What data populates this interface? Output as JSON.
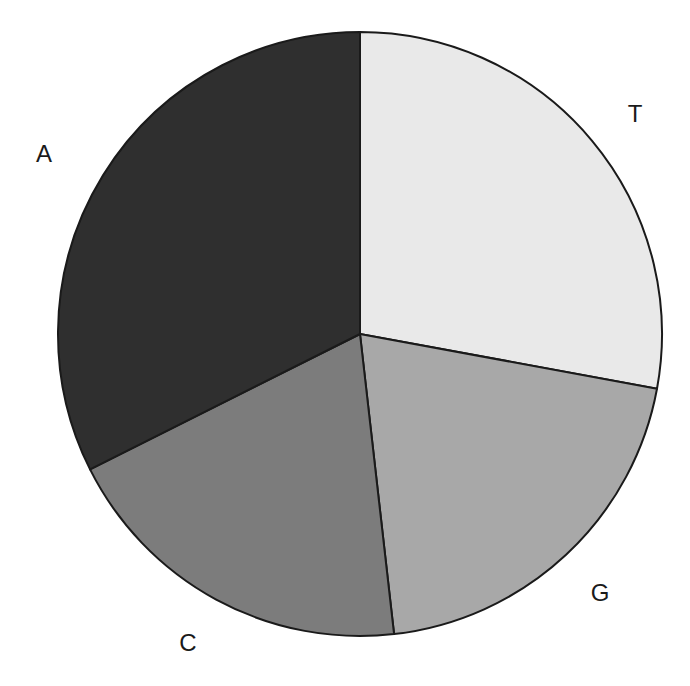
{
  "chart_data": {
    "type": "pie",
    "title": "",
    "start_angle_deg": 0,
    "direction": "clockwise",
    "categories": [
      "T",
      "G",
      "C",
      "A"
    ],
    "values": [
      27.9,
      20.3,
      19.4,
      32.4
    ],
    "colors": [
      "#e9e9e9",
      "#a8a8a8",
      "#7c7c7c",
      "#2f2f2f"
    ],
    "labels": [
      {
        "text": "T",
        "x": 635,
        "y": 122
      },
      {
        "text": "G",
        "x": 600,
        "y": 601
      },
      {
        "text": "C",
        "x": 188,
        "y": 651
      },
      {
        "text": "A",
        "x": 44,
        "y": 162
      }
    ],
    "legend": "none",
    "edge_color": "#1a1a1a"
  },
  "pie": {
    "cx": 360,
    "cy": 334,
    "r": 302
  }
}
